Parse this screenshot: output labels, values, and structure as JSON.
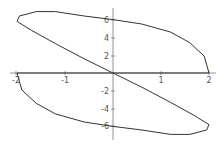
{
  "chart_data": {
    "type": "line",
    "title": "",
    "xlabel": "",
    "ylabel": "",
    "xlim": [
      -2.1,
      2.1
    ],
    "ylim": [
      -7.2,
      7.2
    ],
    "grid": false,
    "x_ticks": [
      "-2",
      "-1",
      "1",
      "2"
    ],
    "y_ticks": [
      "6",
      "4",
      "2",
      "-2",
      "-4",
      "-6"
    ],
    "series": [
      {
        "name": "parametric curve",
        "points": [
          [
            2.0,
            0.0
          ],
          [
            1.9,
            1.9
          ],
          [
            1.6,
            3.4
          ],
          [
            1.2,
            4.6
          ],
          [
            0.6,
            5.5
          ],
          [
            0.0,
            6.0
          ],
          [
            -0.6,
            6.4
          ],
          [
            -1.2,
            6.9
          ],
          [
            -1.6,
            6.9
          ],
          [
            -1.95,
            6.4
          ],
          [
            -2.0,
            5.8
          ],
          [
            -1.7,
            4.8
          ],
          [
            -1.2,
            3.3
          ],
          [
            -0.6,
            1.6
          ],
          [
            0.0,
            0.0
          ],
          [
            0.6,
            -1.6
          ],
          [
            1.2,
            -3.3
          ],
          [
            1.7,
            -4.8
          ],
          [
            2.0,
            -5.8
          ],
          [
            1.95,
            -6.4
          ],
          [
            1.6,
            -6.9
          ],
          [
            1.2,
            -6.9
          ],
          [
            0.6,
            -6.4
          ],
          [
            0.0,
            -6.0
          ],
          [
            -0.6,
            -5.5
          ],
          [
            -1.2,
            -4.6
          ],
          [
            -1.6,
            -3.4
          ],
          [
            -1.9,
            -1.9
          ],
          [
            -2.0,
            0.0
          ]
        ]
      }
    ]
  },
  "axes": {
    "x_labels": [
      {
        "text": "-2",
        "x": 16
      },
      {
        "text": "-1",
        "x": 65
      },
      {
        "text": "1",
        "x": 161
      },
      {
        "text": "2",
        "x": 209
      }
    ],
    "y_labels": [
      {
        "text": "6",
        "y": 20
      },
      {
        "text": "4",
        "y": 38
      },
      {
        "text": "2",
        "y": 56
      },
      {
        "text": "-2",
        "y": 91
      },
      {
        "text": "-4",
        "y": 109
      },
      {
        "text": "-6",
        "y": 126
      }
    ]
  }
}
